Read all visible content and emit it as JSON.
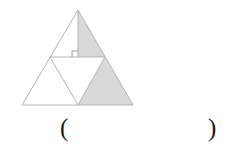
{
  "figure": {
    "colors": {
      "stroke": "#b3b3b3",
      "shade_fill": "#d9d9d9",
      "unshaded_fill": "#ffffff",
      "marker_stroke": "#9a9a9a",
      "text": "#1a1a1a"
    },
    "stroke_width": 1,
    "vertices": {
      "apex": {
        "x": 78,
        "y": 10
      },
      "base_left": {
        "x": 22,
        "y": 105
      },
      "base_right": {
        "x": 133,
        "y": 105
      },
      "mid_left": {
        "x": 50,
        "y": 57
      },
      "mid_right": {
        "x": 105,
        "y": 57
      },
      "mid_base": {
        "x": 78,
        "y": 105
      },
      "foot_of_altitude": {
        "x": 78,
        "y": 57
      }
    },
    "regions": [
      {
        "name": "top-left-half-triangle",
        "points": "78,10 50,57 78,57",
        "shaded": false
      },
      {
        "name": "top-right-half-triangle",
        "points": "78,10 78,57 105,57",
        "shaded": true
      },
      {
        "name": "lower-left-triangle",
        "points": "50,57 22,105 78,105",
        "shaded": false
      },
      {
        "name": "middle-inverted-triangle",
        "points": "50,57 105,57 78,105",
        "shaded": false
      },
      {
        "name": "lower-right-triangle",
        "points": "105,57 78,105 133,105",
        "shaded": true
      }
    ],
    "altitude_line": {
      "x1": 78,
      "y1": 10,
      "x2": 78,
      "y2": 57
    },
    "midsegment_line": {
      "x1": 50,
      "y1": 57,
      "x2": 105,
      "y2": 57
    },
    "right_angle_marker": {
      "name": "right-angle-square",
      "points": "72,51 78,51 78,57 72,57",
      "size": 6
    }
  },
  "answer": {
    "open_paren": "(",
    "close_paren": ")",
    "value": "",
    "placeholder": ""
  }
}
